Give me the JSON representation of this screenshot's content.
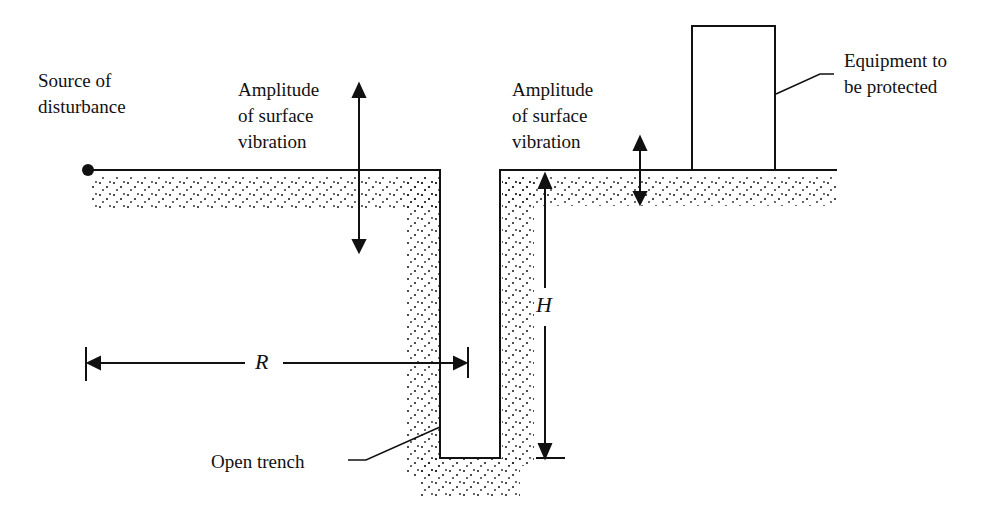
{
  "diagram": {
    "source_label": [
      "Source of",
      "disturbance"
    ],
    "amplitude_left": [
      "Amplitude",
      "of surface",
      "vibration"
    ],
    "amplitude_right": [
      "Amplitude",
      "of surface",
      "vibration"
    ],
    "equipment_label": [
      "Equipment to",
      "be protected"
    ],
    "trench_label": "Open trench",
    "R_label": "R",
    "H_label": "H"
  }
}
